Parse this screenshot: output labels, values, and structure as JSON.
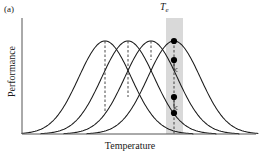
{
  "figure": {
    "panel_label": "(a)",
    "x_axis_label": "Temperature",
    "y_axis_label": "Performance",
    "te_label_main": "T",
    "te_label_sub": "e"
  },
  "colors": {
    "curve": "#1a1a1a",
    "axis": "#555555",
    "band_fill": "#d9d9d9",
    "marker": "#000000",
    "dashed": "#333333",
    "background": "#ffffff"
  },
  "chart_data": {
    "type": "line",
    "title": "",
    "xlabel": "Temperature",
    "ylabel": "Performance",
    "grid": false,
    "legend": "none",
    "axis_ticks": "none",
    "xlim": [
      22,
      258
    ],
    "ylim": [
      134,
      38
    ],
    "shaded_band": {
      "label": "Te",
      "x_start": 166,
      "x_end": 183,
      "y_top": 18,
      "y_bottom": 134
    },
    "series": [
      {
        "name": "curve-1",
        "peak_x": 105,
        "peak_y": 41,
        "width": 62,
        "marker": {
          "x": 174,
          "y": 113,
          "label": "performance at Te"
        },
        "dashed_line": {
          "x": 174,
          "y_top": 41,
          "y_bottom": 113
        }
      },
      {
        "name": "curve-2",
        "peak_x": 128,
        "peak_y": 41,
        "width": 62,
        "marker": {
          "x": 174,
          "y": 97,
          "label": "performance at Te"
        },
        "dashed_line": {
          "x": 174,
          "y_top": 41,
          "y_bottom": 97
        }
      },
      {
        "name": "curve-3",
        "peak_x": 151,
        "peak_y": 41,
        "width": 62,
        "marker": {
          "x": 174,
          "y": 60,
          "label": "performance at Te"
        },
        "dashed_line": {
          "x": 174,
          "y_top": 41,
          "y_bottom": 60
        }
      },
      {
        "name": "curve-4",
        "peak_x": 174,
        "peak_y": 41,
        "width": 62,
        "marker": {
          "x": 174,
          "y": 41,
          "label": "peak performance at Te"
        },
        "dashed_line": {
          "x": 174,
          "y_top": 41,
          "y_bottom": 134
        }
      }
    ],
    "annotation_arrows": [
      {
        "x": 174,
        "y": 70,
        "direction": "down"
      },
      {
        "x": 174,
        "y": 108,
        "direction": "down"
      }
    ],
    "dashed_peak_lines": [
      {
        "x": 105,
        "y_top": 41,
        "y_bottom": 113
      },
      {
        "x": 128,
        "y_top": 41,
        "y_bottom": 97
      },
      {
        "x": 151,
        "y_top": 41,
        "y_bottom": 60
      }
    ]
  }
}
